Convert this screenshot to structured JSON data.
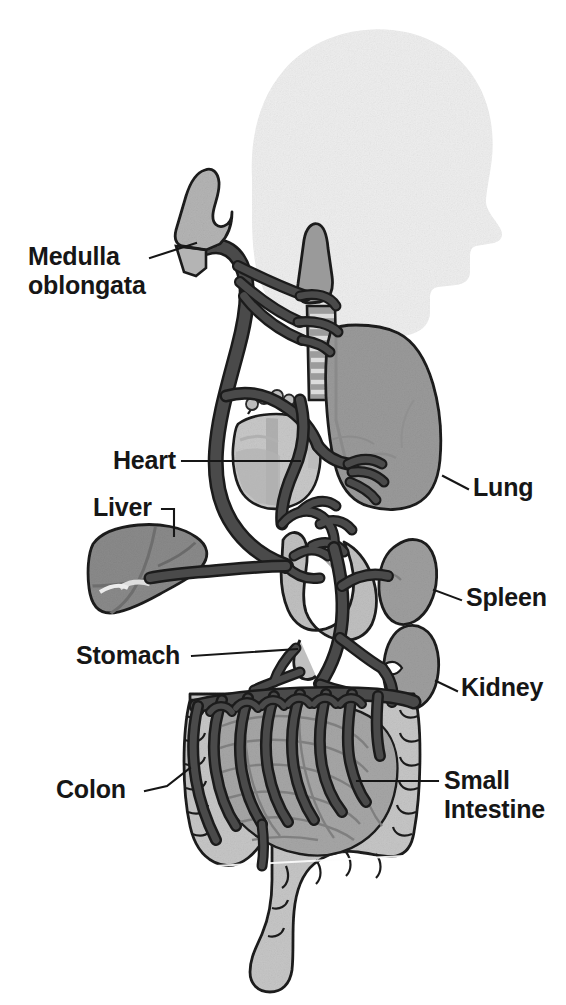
{
  "figure": {
    "background_color": "#ffffff",
    "palette": {
      "nerve": "#4a4a4a",
      "nerve_outline": "#1b1b1b",
      "head_silhouette": "#eeeeee",
      "lung": "#9a9a9a",
      "liver": "#8a8a8a",
      "heart": "#c8c8c8",
      "heart_shadow": "#a9a9a9",
      "stomach": "#c0c0c0",
      "spleen": "#9e9e9e",
      "kidney": "#9e9e9e",
      "colon": "#c6c6c6",
      "small_intestine": "#a6a6a6",
      "medulla": "#b4b4b4",
      "trachea": "#9c9c9c",
      "trachea_ring": "#d8d8d8",
      "label_text": "#161616"
    }
  },
  "labels": [
    {
      "id": "medulla-oblongata",
      "name": "Medulla oblongata",
      "line1": "Medulla",
      "line2": "oblongata",
      "side": "left",
      "text_x": 28,
      "text_y": 265,
      "leader": "M150,258 L196,243"
    },
    {
      "id": "heart",
      "name": "Heart",
      "line1": "Heart",
      "line2": "",
      "side": "left",
      "text_x": 113,
      "text_y": 469,
      "leader": "M182,461 L300,461"
    },
    {
      "id": "liver",
      "name": "Liver",
      "line1": "Liver",
      "line2": "",
      "side": "left",
      "text_x": 93,
      "text_y": 516,
      "leader": "M162,509 L174,509 L174,536"
    },
    {
      "id": "stomach",
      "name": "Stomach",
      "line1": "Stomach",
      "line2": "",
      "side": "left",
      "text_x": 76,
      "text_y": 664,
      "leader": "M192,656 L297,649"
    },
    {
      "id": "colon",
      "name": "Colon",
      "line1": "Colon",
      "line2": "",
      "side": "left",
      "text_x": 56,
      "text_y": 798,
      "leader": "M145,791 L167,786 L190,768"
    },
    {
      "id": "lung",
      "name": "Lung",
      "line1": "Lung",
      "line2": "",
      "side": "right",
      "text_x": 473,
      "text_y": 496,
      "leader": "M443,476 L468,489"
    },
    {
      "id": "spleen",
      "name": "Spleen",
      "line1": "Spleen",
      "line2": "",
      "side": "right",
      "text_x": 466,
      "text_y": 606,
      "leader": "M434,590 L461,600"
    },
    {
      "id": "kidney",
      "name": "Kidney",
      "line1": "Kidney",
      "line2": "",
      "side": "right",
      "text_x": 461,
      "text_y": 696,
      "leader": "M436,681 L457,691"
    },
    {
      "id": "small-intestine",
      "name": "Small Intestine",
      "line1": "Small",
      "line2": "Intestine",
      "side": "right",
      "text_x": 444,
      "text_y": 789,
      "leader": "M357,781 L438,781"
    }
  ],
  "organs": [
    {
      "id": "head-silhouette",
      "name": "Head silhouette"
    },
    {
      "id": "medulla-oblongata",
      "name": "Medulla oblongata"
    },
    {
      "id": "larynx",
      "name": "Larynx"
    },
    {
      "id": "trachea",
      "name": "Trachea"
    },
    {
      "id": "lung",
      "name": "Lung"
    },
    {
      "id": "heart",
      "name": "Heart"
    },
    {
      "id": "liver",
      "name": "Liver"
    },
    {
      "id": "stomach",
      "name": "Stomach"
    },
    {
      "id": "spleen",
      "name": "Spleen"
    },
    {
      "id": "kidney",
      "name": "Kidney"
    },
    {
      "id": "colon",
      "name": "Colon"
    },
    {
      "id": "small-intestine",
      "name": "Small intestine"
    },
    {
      "id": "vagus-nerve",
      "name": "Vagus nerve"
    }
  ]
}
